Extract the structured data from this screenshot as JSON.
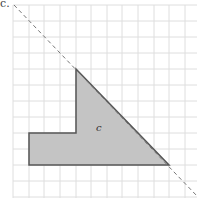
{
  "figure": {
    "part_label": "c.",
    "shape_label": "c",
    "colors": {
      "grid": "#dedede",
      "shape_fill": "#c4c4c4",
      "shape_stroke": "#555555",
      "dashed_line": "#777777"
    },
    "grid": {
      "x_lines": [
        13,
        29,
        44,
        60,
        76,
        91,
        107,
        122,
        138,
        154,
        169,
        185
      ],
      "y_lines": [
        5,
        21,
        37,
        53,
        69,
        85,
        101,
        117,
        133,
        149,
        165,
        181,
        197
      ]
    },
    "shape_points": "76,69 169,165 29,165 29,133 76,133",
    "dashed_line": {
      "x1": 14,
      "y1": 5,
      "x2": 197,
      "y2": 196
    },
    "shape_label_pos": {
      "x": 96,
      "y": 122
    }
  }
}
